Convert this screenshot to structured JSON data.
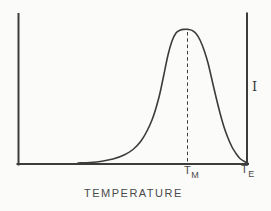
{
  "figure": {
    "x_axis_label": "TEMPERATURE",
    "y_axis_label": "I",
    "peak_temperature_label": {
      "base": "T",
      "subscript": "M"
    },
    "end_temperature_label": {
      "base": "T",
      "subscript": "E"
    },
    "colors": {
      "ink": "#3c3c3c",
      "paper": "#fbfbf9",
      "text": "#4a4a4a"
    }
  },
  "chart_data": {
    "type": "line",
    "title": "",
    "xlabel": "TEMPERATURE",
    "ylabel": "I",
    "axis_ticks": "none (schematic, no numeric scale)",
    "annotations": [
      "vertical dashed line at curve peak, labeled T_M on x-axis",
      "right vertical axis at x-axis label T_E",
      "y-axis symbol I beside right vertical axis"
    ],
    "curve_points_px": [
      [
        78,
        163
      ],
      [
        90,
        162.5
      ],
      [
        102,
        161.2
      ],
      [
        113,
        159
      ],
      [
        124,
        155
      ],
      [
        133,
        149.5
      ],
      [
        141,
        141
      ],
      [
        147,
        131
      ],
      [
        152,
        120
      ],
      [
        156,
        108
      ],
      [
        160,
        93
      ],
      [
        164,
        74
      ],
      [
        168,
        55
      ],
      [
        172,
        41
      ],
      [
        176,
        33
      ],
      [
        180,
        30.2
      ],
      [
        184,
        29.4
      ],
      [
        188,
        29.4
      ],
      [
        192,
        30.4
      ],
      [
        196,
        33.5
      ],
      [
        200,
        40
      ],
      [
        204,
        50
      ],
      [
        208,
        63
      ],
      [
        212,
        80
      ],
      [
        216,
        97
      ],
      [
        220,
        113
      ],
      [
        224,
        127
      ],
      [
        228,
        138
      ],
      [
        232,
        147
      ],
      [
        236,
        153.5
      ],
      [
        240,
        158.5
      ],
      [
        244,
        161.2
      ],
      [
        248,
        163.2
      ]
    ],
    "peak_line_px": {
      "x": 187.5,
      "y_top": 32,
      "y_bottom": 162
    }
  }
}
